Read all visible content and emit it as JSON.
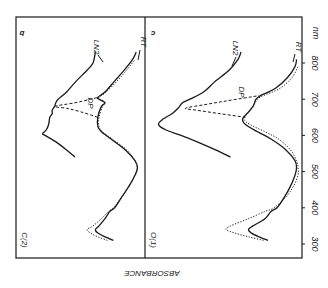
{
  "figure": {
    "orientation": "rotated-180",
    "ink_color": "#1a1a1a",
    "background": "#ffffff"
  },
  "chart_data": [
    {
      "type": "line",
      "panel": "b",
      "sample_label": "C(2)",
      "title": "",
      "xlabel": "nm",
      "ylabel": "ABSORBANCE",
      "xlim": [
        300,
        850
      ],
      "x_ticks": [
        300,
        400,
        500,
        600,
        700,
        800
      ],
      "grid": false,
      "series": [
        {
          "name": "LN2",
          "style": "solid",
          "x": [
            540,
            560,
            580,
            600,
            605,
            615,
            630,
            650,
            660,
            670,
            680,
            690,
            700,
            720,
            750,
            780,
            800,
            830
          ],
          "y": [
            0.55,
            0.62,
            0.7,
            0.8,
            0.82,
            0.79,
            0.77,
            0.76,
            0.74,
            0.74,
            0.72,
            0.71,
            0.69,
            0.62,
            0.54,
            0.45,
            0.4,
            0.38
          ]
        },
        {
          "name": "RT",
          "style": "solid",
          "x": [
            310,
            320,
            330,
            340,
            350,
            370,
            390,
            400,
            430,
            460,
            490,
            510,
            530,
            560,
            590,
            610,
            625,
            650,
            680,
            690,
            700,
            705,
            720,
            750,
            780,
            810,
            830
          ],
          "y": [
            0.23,
            0.3,
            0.36,
            0.38,
            0.35,
            0.3,
            0.26,
            0.22,
            0.16,
            0.1,
            0.05,
            0.03,
            0.05,
            0.13,
            0.25,
            0.33,
            0.36,
            0.36,
            0.33,
            0.3,
            0.35,
            0.36,
            0.3,
            0.22,
            0.14,
            0.07,
            0.04
          ]
        },
        {
          "name": "RT (dotted)",
          "style": "dotted",
          "x": [
            310,
            320,
            330,
            340,
            350,
            370,
            390,
            400,
            430,
            460,
            490,
            510,
            530,
            560,
            590,
            610,
            625,
            650,
            680,
            690,
            700,
            705,
            720,
            750,
            780,
            810
          ],
          "y": [
            0.28,
            0.36,
            0.42,
            0.45,
            0.4,
            0.33,
            0.27,
            0.23,
            0.16,
            0.1,
            0.05,
            0.03,
            0.05,
            0.12,
            0.24,
            0.32,
            0.35,
            0.35,
            0.32,
            0.3,
            0.34,
            0.35,
            0.29,
            0.2,
            0.12,
            0.05
          ]
        },
        {
          "name": "DP",
          "style": "dashed",
          "x": [
            650,
            665,
            675,
            680,
            690,
            700,
            705
          ],
          "y": [
            0.36,
            0.5,
            0.62,
            0.72,
            0.55,
            0.42,
            0.36
          ]
        }
      ],
      "annotations": [
        "LN2",
        "RT",
        "DP",
        "b"
      ]
    },
    {
      "type": "line",
      "panel": "c",
      "sample_label": "O(1)",
      "title": "",
      "xlabel": "nm",
      "ylabel": "ABSORBANCE",
      "xlim": [
        300,
        850
      ],
      "x_ticks": [
        300,
        400,
        500,
        600,
        700,
        800
      ],
      "grid": false,
      "series": [
        {
          "name": "LN2",
          "style": "solid",
          "x": [
            540,
            560,
            580,
            600,
            615,
            630,
            645,
            660,
            675,
            690,
            700,
            720,
            750,
            780,
            810,
            830
          ],
          "y": [
            0.45,
            0.55,
            0.66,
            0.78,
            0.88,
            0.93,
            0.9,
            0.84,
            0.8,
            0.77,
            0.72,
            0.63,
            0.55,
            0.46,
            0.4,
            0.38
          ]
        },
        {
          "name": "RT",
          "style": "solid",
          "x": [
            310,
            320,
            330,
            340,
            350,
            370,
            390,
            400,
            430,
            460,
            490,
            510,
            530,
            560,
            590,
            610,
            630,
            645,
            660,
            680,
            700,
            710,
            730,
            760,
            790,
            810
          ],
          "y": [
            0.2,
            0.26,
            0.31,
            0.33,
            0.3,
            0.22,
            0.18,
            0.14,
            0.09,
            0.05,
            0.02,
            0.01,
            0.02,
            0.08,
            0.18,
            0.27,
            0.35,
            0.37,
            0.34,
            0.3,
            0.28,
            0.25,
            0.15,
            0.07,
            0.02,
            0.01
          ]
        },
        {
          "name": "RT (dotted)",
          "style": "dotted",
          "x": [
            310,
            320,
            330,
            340,
            350,
            370,
            390,
            400,
            430,
            460,
            490,
            510,
            530,
            560,
            590,
            610,
            630,
            645,
            660,
            680,
            700,
            710,
            730,
            760,
            790
          ],
          "y": [
            0.23,
            0.33,
            0.42,
            0.48,
            0.45,
            0.33,
            0.22,
            0.16,
            0.08,
            0.03,
            0.0,
            0.0,
            0.01,
            0.05,
            0.13,
            0.22,
            0.32,
            0.36,
            0.34,
            0.3,
            0.27,
            0.23,
            0.12,
            0.04,
            0.0
          ]
        },
        {
          "name": "DP",
          "style": "dashed",
          "x": [
            650,
            660,
            670,
            675,
            685,
            695,
            710
          ],
          "y": [
            0.35,
            0.52,
            0.68,
            0.75,
            0.62,
            0.48,
            0.26
          ]
        }
      ],
      "annotations": [
        "LN2",
        "RT",
        "DP",
        "c"
      ]
    }
  ],
  "labels": {
    "panel_b": "b",
    "panel_c": "c",
    "sample_b": "C(2)",
    "sample_c": "O(1)",
    "ln2": "LN2",
    "rt": "RT",
    "dp": "DP",
    "unit": "nm",
    "ylabel": "ABSORBANCE",
    "ticks": [
      "300",
      "400",
      "500",
      "600",
      "700",
      "800"
    ]
  }
}
